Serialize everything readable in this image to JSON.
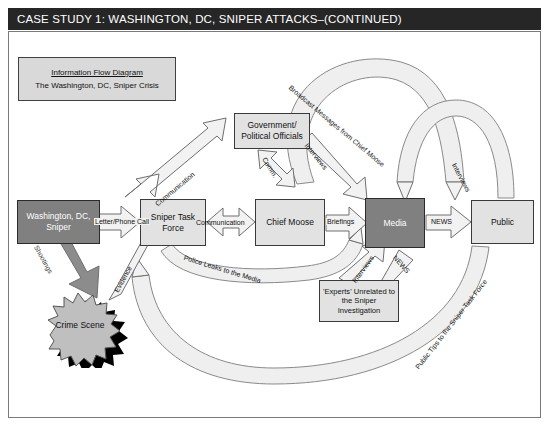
{
  "header": {
    "title": "CASE STUDY 1: WASHINGTON, DC, SNIPER ATTACKS–(CONTINUED)"
  },
  "legend": {
    "title": "Information Flow Diagram",
    "subtitle": "The Washington, DC, Sniper Crisis"
  },
  "nodes": {
    "sniper": "Washington, DC, Sniper",
    "crime_scene": "Crime Scene",
    "sniper_task_force": "Sniper Task Force",
    "government": "Government/ Political Officials",
    "chief_moose": "Chief Moose",
    "media": "Media",
    "public": "Public",
    "experts": "'Experts' Unrelated to the Sniper Investigation"
  },
  "edges": [
    {
      "id": "shootings",
      "label": "Shootings",
      "from": "sniper",
      "to": "crime_scene"
    },
    {
      "id": "letter-phone",
      "label": "Letter/Phone Call",
      "from": "sniper",
      "to": "sniper_task_force"
    },
    {
      "id": "evidence",
      "label": "Evidence",
      "from": "crime_scene",
      "to": "sniper_task_force"
    },
    {
      "id": "communication-gov",
      "label": "Communication",
      "from": "sniper_task_force",
      "to": "government"
    },
    {
      "id": "communication-cm",
      "label": "Communication",
      "from": "sniper_task_force",
      "to": "chief_moose"
    },
    {
      "id": "comm-gov-moose",
      "label": "Comm.",
      "from": "government",
      "to": "chief_moose"
    },
    {
      "id": "briefings",
      "label": "Briefings",
      "from": "chief_moose",
      "to": "media"
    },
    {
      "id": "interviews-gov",
      "label": "Interviews",
      "from": "government",
      "to": "media"
    },
    {
      "id": "broadcast",
      "label": "Broadcast Messages from Chief Moose",
      "from": "chief_moose",
      "to": "public"
    },
    {
      "id": "news-public",
      "label": "NEWS",
      "from": "media",
      "to": "public"
    },
    {
      "id": "news-experts",
      "label": "NEWS",
      "from": "media",
      "to": "experts"
    },
    {
      "id": "interviews-public",
      "label": "Interviews",
      "from": "public",
      "to": "media"
    },
    {
      "id": "interviews-experts",
      "label": "Interviews",
      "from": "experts",
      "to": "media"
    },
    {
      "id": "police-leaks",
      "label": "Police Leaks to the Media",
      "from": "sniper_task_force",
      "to": "media"
    },
    {
      "id": "public-tips",
      "label": "Public Tips to the Sniper Task Force",
      "from": "public",
      "to": "sniper_task_force"
    }
  ],
  "colors": {
    "header_bg": "#262626",
    "header_text": "#ffffff",
    "node_fill": "#e2e2e2",
    "node_dark_fill": "#808080",
    "node_stroke": "#3a3a3a",
    "legend_fill": "#d9d9d9",
    "crime_scene_fill": "#bfbfbf",
    "crime_scene_shadow": "#000000",
    "arrow_fill": "#f2f2f2",
    "arrow_stroke": "#6e6e6e",
    "arrow_dark_fill": "#8c8c8c",
    "canvas_bg": "#ffffff",
    "canvas_border": "#7a7a7a"
  }
}
